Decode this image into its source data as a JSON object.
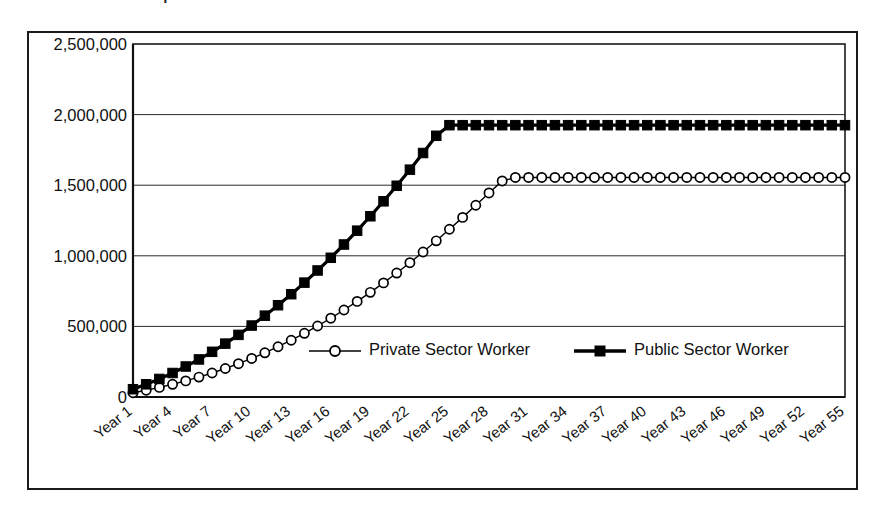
{
  "title_remnant": "Comparison of Accumulated Pension Wealth",
  "chart_data": {
    "type": "line",
    "title": "",
    "xlabel": "",
    "ylabel": "",
    "ylim": [
      0,
      2500000
    ],
    "y_ticks": [
      0,
      500000,
      1000000,
      1500000,
      2000000,
      2500000
    ],
    "y_tick_labels": [
      "0",
      "500,000",
      "1,000,000",
      "1,500,000",
      "2,000,000",
      "2,500,000"
    ],
    "grid": true,
    "legend_position": "inside-bottom-center",
    "x": [
      1,
      2,
      3,
      4,
      5,
      6,
      7,
      8,
      9,
      10,
      11,
      12,
      13,
      14,
      15,
      16,
      17,
      18,
      19,
      20,
      21,
      22,
      23,
      24,
      25,
      26,
      27,
      28,
      29,
      30,
      31,
      32,
      33,
      34,
      35,
      36,
      37,
      38,
      39,
      40,
      41,
      42,
      43,
      44,
      45,
      46,
      47,
      48,
      49,
      50,
      51,
      52,
      53,
      54,
      55
    ],
    "x_tick_labels": [
      "Year 1",
      "Year 4",
      "Year 7",
      "Year 10",
      "Year 13",
      "Year 16",
      "Year 19",
      "Year 22",
      "Year 25",
      "Year 28",
      "Year 31",
      "Year 34",
      "Year 37",
      "Year 40",
      "Year 43",
      "Year 46",
      "Year 49",
      "Year 52",
      "Year 55"
    ],
    "x_tick_positions": [
      1,
      4,
      7,
      10,
      13,
      16,
      19,
      22,
      25,
      28,
      31,
      34,
      37,
      40,
      43,
      46,
      49,
      52,
      55
    ],
    "series": [
      {
        "name": "Private Sector Worker",
        "marker": "open-circle",
        "color": "#000000",
        "line_width": 1.4,
        "values": [
          30000,
          48000,
          68000,
          90000,
          114000,
          141000,
          170000,
          202000,
          236000,
          273000,
          313000,
          356000,
          402000,
          451000,
          503000,
          558000,
          616000,
          677000,
          741000,
          808000,
          878000,
          951000,
          1027000,
          1106000,
          1188000,
          1272000,
          1358000,
          1445000,
          1530000,
          1555000,
          1555000,
          1555000,
          1555000,
          1555000,
          1555000,
          1555000,
          1555000,
          1555000,
          1555000,
          1555000,
          1555000,
          1555000,
          1555000,
          1555000,
          1555000,
          1555000,
          1555000,
          1555000,
          1555000,
          1555000,
          1555000,
          1555000,
          1555000,
          1555000,
          1555000
        ]
      },
      {
        "name": "Public Sector Worker",
        "marker": "filled-square",
        "color": "#000000",
        "line_width": 3.2,
        "values": [
          55000,
          90000,
          128000,
          170000,
          216000,
          266000,
          320000,
          378000,
          440000,
          506000,
          576000,
          650000,
          728000,
          810000,
          896000,
          986000,
          1080000,
          1178000,
          1280000,
          1386000,
          1496000,
          1610000,
          1728000,
          1850000,
          1925000,
          1925000,
          1925000,
          1925000,
          1925000,
          1925000,
          1925000,
          1925000,
          1925000,
          1925000,
          1925000,
          1925000,
          1925000,
          1925000,
          1925000,
          1925000,
          1925000,
          1925000,
          1925000,
          1925000,
          1925000,
          1925000,
          1925000,
          1925000,
          1925000,
          1925000,
          1925000,
          1925000,
          1925000,
          1925000,
          1925000
        ]
      }
    ],
    "legend": [
      {
        "label": "Private Sector Worker",
        "marker": "open-circle"
      },
      {
        "label": "Public Sector Worker",
        "marker": "filled-square"
      }
    ]
  }
}
